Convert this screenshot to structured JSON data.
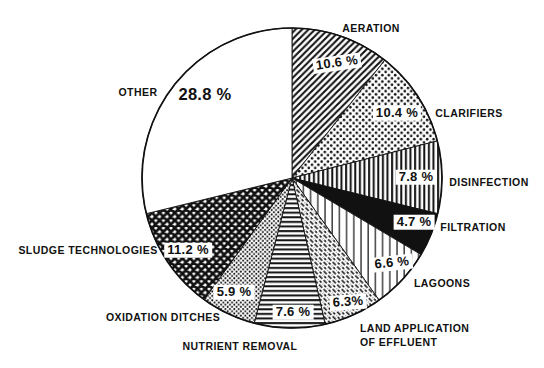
{
  "colors": {
    "ink": "#111111",
    "background": "#ffffff"
  },
  "chart_data": {
    "type": "pie",
    "title": "",
    "unit": "%",
    "legend": "none",
    "labels_position": "around",
    "direction": "clockwise",
    "start_angle_deg": 0,
    "center": {
      "x": 292,
      "y": 178
    },
    "radius": 150,
    "categories": [
      "AERATION",
      "CLARIFIERS",
      "DISINFECTION",
      "FILTRATION",
      "LAGOONS",
      "LAND APPLICATION OF EFFLUENT",
      "NUTRIENT REMOVAL",
      "OXIDATION DITCHES",
      "SLUDGE TECHNOLOGIES",
      "OTHER"
    ],
    "values": [
      10.6,
      10.4,
      7.8,
      4.7,
      6.6,
      6.3,
      7.6,
      5.9,
      11.2,
      28.8
    ],
    "slices": [
      {
        "label": "AERATION",
        "value": 10.6,
        "pct_label": "10.6 %",
        "pattern": "diagonal-lines",
        "label_x": 371,
        "label_y": 28,
        "label_align": "center",
        "pct_x": 337,
        "pct_y": 63,
        "pct_rotate": -8,
        "pct_size": 13
      },
      {
        "label": "CLARIFIERS",
        "value": 10.4,
        "pct_label": "10.4 %",
        "pattern": "dots",
        "label_x": 469,
        "label_y": 113,
        "label_align": "center",
        "pct_x": 397,
        "pct_y": 113,
        "pct_rotate": 0,
        "pct_size": 13
      },
      {
        "label": "DISINFECTION",
        "value": 7.8,
        "pct_label": "7.8 %",
        "pattern": "vertical-lines-dense",
        "label_x": 489,
        "label_y": 182,
        "label_align": "center",
        "pct_x": 416,
        "pct_y": 177,
        "pct_rotate": 0,
        "pct_size": 13
      },
      {
        "label": "FILTRATION",
        "value": 4.7,
        "pct_label": "4.7 %",
        "pattern": "solid-black",
        "label_x": 473,
        "label_y": 227,
        "label_align": "center",
        "pct_x": 414,
        "pct_y": 222,
        "pct_rotate": 0,
        "pct_size": 13
      },
      {
        "label": "LAGOONS",
        "value": 6.6,
        "pct_label": "6.6 %",
        "pattern": "vertical-lines-sparse",
        "label_x": 442,
        "label_y": 283,
        "label_align": "center",
        "pct_x": 392,
        "pct_y": 263,
        "pct_rotate": -6,
        "pct_size": 13
      },
      {
        "label": "LAND APPLICATION\nOF EFFLUENT",
        "value": 6.3,
        "pct_label": "6.3%",
        "pattern": "diagonal-dashes",
        "label_x": 360,
        "label_y": 335,
        "label_align": "left",
        "pct_x": 348,
        "pct_y": 302,
        "pct_rotate": -4,
        "pct_size": 13
      },
      {
        "label": "NUTRIENT REMOVAL",
        "value": 7.6,
        "pct_label": "7.6 %",
        "pattern": "horizontal-lines",
        "label_x": 240,
        "label_y": 346,
        "label_align": "center",
        "pct_x": 293,
        "pct_y": 312,
        "pct_rotate": 0,
        "pct_size": 13
      },
      {
        "label": "OXIDATION DITCHES",
        "value": 5.9,
        "pct_label": "5.9 %",
        "pattern": "fine-check",
        "label_x": 163,
        "label_y": 317,
        "label_align": "center",
        "pct_x": 234,
        "pct_y": 292,
        "pct_rotate": 0,
        "pct_size": 13
      },
      {
        "label": "SLUDGE TECHNOLOGIES",
        "value": 11.2,
        "pct_label": "11.2 %",
        "pattern": "crosshatch",
        "label_x": 88,
        "label_y": 250,
        "label_align": "center",
        "pct_x": 188,
        "pct_y": 250,
        "pct_rotate": 0,
        "pct_size": 13
      },
      {
        "label": "OTHER",
        "value": 28.8,
        "pct_label": "28.8 %",
        "pattern": "white",
        "label_x": 138,
        "label_y": 92,
        "label_align": "center",
        "pct_x": 205,
        "pct_y": 94,
        "pct_rotate": 0,
        "pct_size": 16.5
      }
    ]
  }
}
